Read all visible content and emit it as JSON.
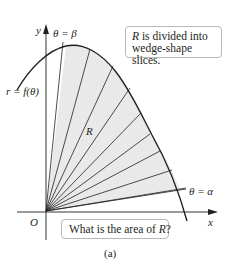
{
  "figure": {
    "caption": "(a)",
    "colors": {
      "region_fill": "#e9e9e9",
      "stroke": "#231f20",
      "callout_border": "#b8b8b8"
    },
    "axes": {
      "x_label": "x",
      "y_label": "y",
      "origin_label": "O"
    },
    "curve_label": "r = f(θ)",
    "region_label": "R",
    "ray_labels": {
      "beta": "θ = β",
      "alpha": "θ = α"
    },
    "num_rays": 11,
    "callouts": {
      "top": {
        "italic_part": "R",
        "line1_rest": " is divided into",
        "line2": "wedge-shape slices."
      },
      "bottom": {
        "text_before": "What is the area of ",
        "italic_part": "R",
        "text_after": "?"
      }
    }
  }
}
